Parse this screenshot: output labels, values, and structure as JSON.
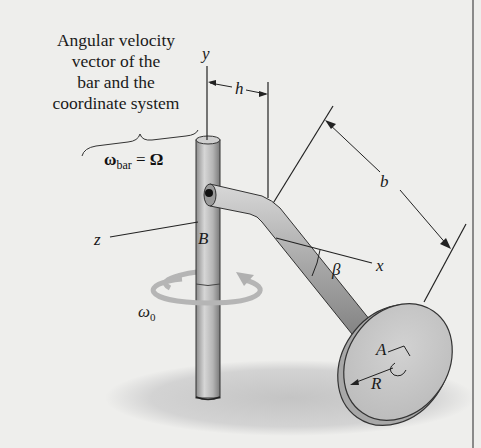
{
  "figure": {
    "caption_lines": [
      "Angular velocity",
      "vector of the",
      "bar and the",
      "coordinate system"
    ],
    "omega_bar_equation": {
      "symbol": "ω",
      "subscript": "bar",
      "equals": "=",
      "rhs": "Ω"
    },
    "omega_0": {
      "symbol": "ω",
      "subscript": "0"
    },
    "axes": {
      "y": "y",
      "z": "z",
      "x": "x"
    },
    "points": {
      "B": "B",
      "A": "A"
    },
    "dimensions": {
      "h": "h",
      "b": "b",
      "R": "R"
    },
    "angle": "β"
  },
  "colors": {
    "background": "#eeeeec",
    "bar_fill": "#b0b0b0",
    "shadow": "#cfcfcf",
    "line": "#1a1a1a"
  }
}
